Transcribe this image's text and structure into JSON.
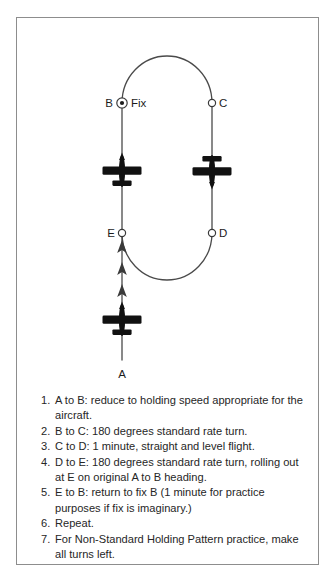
{
  "frame": {
    "border_color": "#8d8d8d",
    "background": "#ffffff"
  },
  "diagram": {
    "title_semantic": "holding-pattern-racetrack-diagram",
    "stroke_color": "#4a4a4a",
    "aircraft_color": "#111111",
    "points": [
      {
        "id": "A",
        "label": "A",
        "marker": "none",
        "label_side": "below",
        "x": 122,
        "y": 370
      },
      {
        "id": "B",
        "label": "B",
        "extra_label": "Fix",
        "marker": "fix-circle",
        "label_side": "left",
        "x": 122,
        "y": 103
      },
      {
        "id": "C",
        "label": "C",
        "marker": "open-circle",
        "label_side": "right",
        "x": 212,
        "y": 103
      },
      {
        "id": "D",
        "label": "D",
        "marker": "open-circle",
        "label_side": "right",
        "x": 212,
        "y": 233
      },
      {
        "id": "E",
        "label": "E",
        "marker": "open-circle",
        "label_side": "left",
        "x": 122,
        "y": 233
      }
    ],
    "fix_label": "Fix",
    "aircraft": [
      {
        "name": "aircraft-inbound-leg",
        "heading": "north",
        "x": 122,
        "y": 171
      },
      {
        "name": "aircraft-outbound-leg",
        "heading": "south",
        "x": 212,
        "y": 171
      },
      {
        "name": "aircraft-entry-leg",
        "heading": "north",
        "x": 122,
        "y": 320
      }
    ],
    "direction_arrows": [
      {
        "x": 122,
        "y": 247
      },
      {
        "x": 122,
        "y": 269
      },
      {
        "x": 122,
        "y": 291
      }
    ]
  },
  "instructions": {
    "heading": "",
    "steps": [
      {
        "num": "1.",
        "text": "A to B: reduce to holding speed appropriate for the aircraft."
      },
      {
        "num": "2.",
        "text": "B to C: 180 degrees standard rate turn."
      },
      {
        "num": "3.",
        "text": "C to D: 1 minute, straight and level flight."
      },
      {
        "num": "4.",
        "text": "D to E: 180 degrees standard rate turn, rolling out at E on original A to B heading."
      },
      {
        "num": "5.",
        "text": "E to B: return to fix B (1 minute for practice purposes if fix is imaginary.)"
      },
      {
        "num": "6.",
        "text": "Repeat."
      },
      {
        "num": "7.",
        "text": "For Non-Standard Holding Pattern practice, make all turns left."
      }
    ]
  }
}
